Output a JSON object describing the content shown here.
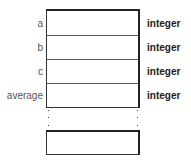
{
  "diagram": {
    "variables": [
      {
        "name": "a",
        "type": "integer"
      },
      {
        "name": "b",
        "type": "integer"
      },
      {
        "name": "c",
        "type": "integer"
      },
      {
        "name": "average",
        "type": "integer"
      }
    ],
    "continuation": "⋮"
  }
}
